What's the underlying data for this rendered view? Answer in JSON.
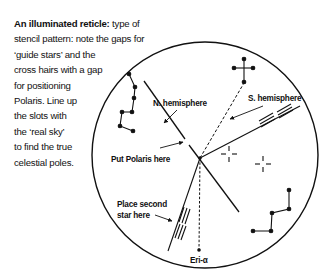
{
  "caption": {
    "lead": "An illuminated reticle:",
    "lines": [
      " type of",
      "stencil pattern: note the gaps for",
      "‘guide stars’ and the",
      "cross hairs with a gap",
      "for positioning",
      "Polaris. Line up",
      "the slots with",
      "the ‘real sky’",
      "to find the true",
      "celestial poles."
    ]
  },
  "diagram": {
    "labels": {
      "north": "N. hemisphere",
      "south": "S. hemisphere",
      "polaris": "Put Polaris here",
      "second_star_1": "Place second",
      "second_star_2": "star here",
      "eri": "Eri-α"
    },
    "reticle_circle": {
      "cx": 205,
      "cy": 155,
      "r": 113
    },
    "center_point": {
      "x": 200,
      "y": 158
    },
    "constellations": {
      "big_dipper": [
        [
          129,
          74
        ],
        [
          135,
          87
        ],
        [
          134,
          98
        ],
        [
          132,
          112
        ],
        [
          122,
          112
        ],
        [
          120,
          126
        ],
        [
          133,
          131
        ]
      ],
      "southern_cross": {
        "top": [
          244,
          59
        ],
        "left": [
          234,
          68
        ],
        "right": [
          253,
          68
        ],
        "bottom": [
          244,
          82
        ]
      },
      "lower_right": [
        [
          289,
          190
        ],
        [
          289,
          209
        ],
        [
          272,
          213
        ],
        [
          271,
          231
        ],
        [
          253,
          231
        ]
      ]
    },
    "crosshairs": [
      [
        229,
        154
      ],
      [
        263,
        164
      ]
    ],
    "colors": {
      "ink": "#111111",
      "background": "#ffffff"
    }
  }
}
